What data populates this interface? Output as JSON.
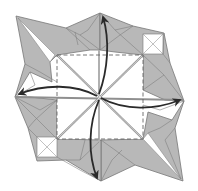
{
  "diagram": {
    "type": "origami-step",
    "colors": {
      "paper_shaded": "#b8b8b8",
      "paper_white": "#ffffff",
      "edge": "#777777",
      "crease": "#9a9a9a",
      "arrow": "#2a2a2a",
      "dashed_line": "#666666"
    },
    "elements": {
      "dashed_square": {
        "x": 57,
        "y": 55,
        "w": 86,
        "h": 84,
        "style": "valley-fold-dashed"
      },
      "center": {
        "x": 99,
        "y": 96
      },
      "arrows": [
        {
          "name": "arrow-up",
          "direction": "up"
        },
        {
          "name": "arrow-left",
          "direction": "left"
        },
        {
          "name": "arrow-right",
          "direction": "right"
        },
        {
          "name": "arrow-down",
          "direction": "down"
        }
      ]
    }
  }
}
